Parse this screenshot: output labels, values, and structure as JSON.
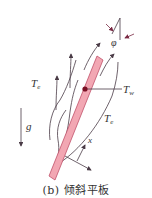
{
  "figure": {
    "caption": "(b)  倾斜平板",
    "labels": {
      "te_left_main": "T",
      "te_left_sub": "e",
      "te_right_main": "T",
      "te_right_sub": "e",
      "tw_main": "T",
      "tw_sub": "w",
      "gravity": "g",
      "angle": "φ",
      "axis_x": "x"
    },
    "colors": {
      "plate_fill": "#f2a7b3",
      "plate_stroke": "#c0506a",
      "dot": "#7a0f24",
      "lines": "#4a3b46"
    },
    "elements": [
      "inclined-plate",
      "boundary-layer-streamlines",
      "flow-arrows",
      "gravity-arrow",
      "angle-indicator",
      "x-axis-indicator",
      "wall-temperature-marker"
    ]
  }
}
